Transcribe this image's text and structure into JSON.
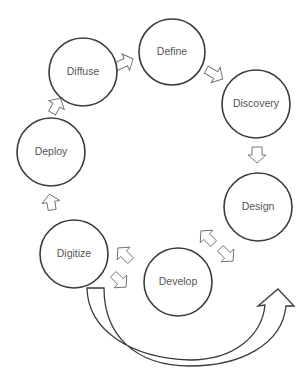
{
  "diagram": {
    "type": "cycle",
    "stroke_color": "#3a3a3a",
    "text_color": "#555555",
    "nodes": [
      {
        "id": "define",
        "label": "Define"
      },
      {
        "id": "discovery",
        "label": "Discovery"
      },
      {
        "id": "design",
        "label": "Design"
      },
      {
        "id": "develop",
        "label": "Develop"
      },
      {
        "id": "digitize",
        "label": "Digitize"
      },
      {
        "id": "deploy",
        "label": "Deploy"
      },
      {
        "id": "diffuse",
        "label": "Diffuse"
      }
    ],
    "connections": [
      {
        "from": "diffuse",
        "to": "define"
      },
      {
        "from": "define",
        "to": "discovery"
      },
      {
        "from": "discovery",
        "to": "design"
      },
      {
        "from": "design",
        "to": "develop",
        "bidirectional": true
      },
      {
        "from": "develop",
        "to": "digitize",
        "bidirectional": true
      },
      {
        "from": "digitize",
        "to": "deploy"
      },
      {
        "from": "deploy",
        "to": "diffuse"
      },
      {
        "from": "digitize",
        "to": "design",
        "style": "large-curved-arrow"
      }
    ]
  }
}
